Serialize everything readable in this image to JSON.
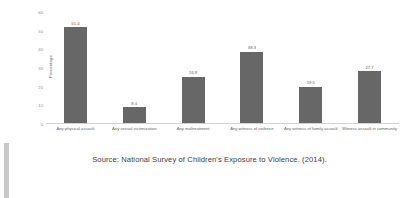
{
  "caption": "Source: National Survey of Children's Exposure to Violence. (2014).",
  "chart_data": {
    "type": "bar",
    "title": "",
    "xlabel": "",
    "ylabel": "Percentage",
    "ylim": [
      0,
      60
    ],
    "yticks": [
      0,
      10,
      20,
      30,
      40,
      50,
      60
    ],
    "grid": false,
    "legend": false,
    "bar_color": "#676767",
    "categories": [
      "Any physical assault",
      "Any sexual victimization",
      "Any maltreatment",
      "Any witness of violence",
      "Any witness of family assault",
      "Witness assault in community"
    ],
    "values": [
      51.4,
      8.4,
      24.9,
      38.3,
      19.5,
      27.7
    ],
    "value_labels": [
      "51.4",
      "8.4",
      "24.9",
      "38.3",
      "19.5",
      "27.7"
    ]
  }
}
